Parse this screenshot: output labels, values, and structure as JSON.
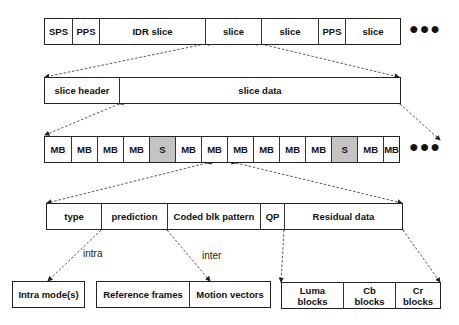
{
  "bitstream_row": {
    "cells": [
      {
        "label": "SPS",
        "shaded": false
      },
      {
        "label": "PPS",
        "shaded": false
      },
      {
        "label": "IDR slice",
        "shaded": false
      },
      {
        "label": "slice",
        "shaded": false
      },
      {
        "label": "slice",
        "shaded": false
      },
      {
        "label": "PPS",
        "shaded": false
      },
      {
        "label": "slice",
        "shaded": false
      }
    ],
    "continuation": "●●●"
  },
  "slice_row": {
    "cells": [
      {
        "label": "slice header"
      },
      {
        "label": "slice data"
      }
    ]
  },
  "slice_data_row": {
    "cells": [
      {
        "label": "MB",
        "shaded": false
      },
      {
        "label": "MB",
        "shaded": false
      },
      {
        "label": "MB",
        "shaded": false
      },
      {
        "label": "MB",
        "shaded": false
      },
      {
        "label": "S",
        "shaded": true
      },
      {
        "label": "MB",
        "shaded": false
      },
      {
        "label": "MB",
        "shaded": false
      },
      {
        "label": "MB",
        "shaded": false
      },
      {
        "label": "MB",
        "shaded": false
      },
      {
        "label": "MB",
        "shaded": false
      },
      {
        "label": "MB",
        "shaded": false
      },
      {
        "label": "S",
        "shaded": true
      },
      {
        "label": "MB",
        "shaded": false
      },
      {
        "label": "MB",
        "shaded": false
      }
    ],
    "continuation": "●●●",
    "shade_color": "#c4c4c4"
  },
  "macroblock_row": {
    "cells": [
      {
        "label": "type"
      },
      {
        "label": "prediction"
      },
      {
        "label": "Coded blk pattern"
      },
      {
        "label": "QP"
      },
      {
        "label": "Residual data"
      }
    ]
  },
  "prediction_branch_labels": {
    "intra": "intra",
    "inter": "inter"
  },
  "intra_box": {
    "label": "Intra mode(s)"
  },
  "inter_row": {
    "cells": [
      {
        "label": "Reference frames"
      },
      {
        "label": "Motion vectors"
      }
    ]
  },
  "residual_row": {
    "cells": [
      {
        "label": "Luma blocks"
      },
      {
        "label": "Cb blocks"
      },
      {
        "label": "Cr blocks"
      }
    ]
  }
}
